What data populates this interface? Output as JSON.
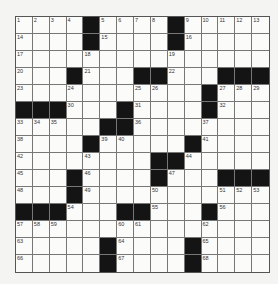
{
  "puzzle": {
    "rows": 15,
    "cols": 15,
    "block_color": "#141414",
    "grid": [
      [
        "1",
        "2",
        "3",
        "4",
        "#",
        "5",
        "6",
        "7",
        "8",
        "#",
        "9",
        "10",
        "11",
        "12",
        "13"
      ],
      [
        "14",
        ".",
        ".",
        ".",
        "#",
        "15",
        ".",
        ".",
        ".",
        "#",
        "16",
        ".",
        ".",
        ".",
        "."
      ],
      [
        "17",
        ".",
        ".",
        ".",
        "18",
        ".",
        ".",
        ".",
        ".",
        "19",
        ".",
        ".",
        ".",
        ".",
        "."
      ],
      [
        "20",
        ".",
        ".",
        "#",
        "21",
        ".",
        ".",
        "#",
        "#",
        "22",
        ".",
        ".",
        "#",
        "#",
        "#"
      ],
      [
        "23",
        ".",
        ".",
        "24",
        ".",
        ".",
        ".",
        "25",
        "26",
        ".",
        ".",
        "#",
        "27",
        "28",
        "29"
      ],
      [
        "#",
        "#",
        "#",
        "30",
        ".",
        ".",
        "#",
        "31",
        ".",
        ".",
        ".",
        "#",
        "32",
        ".",
        "."
      ],
      [
        "33",
        "34",
        "35",
        ".",
        ".",
        "#",
        "#",
        "36",
        ".",
        ".",
        ".",
        "37",
        ".",
        ".",
        "."
      ],
      [
        "38",
        ".",
        ".",
        ".",
        "#",
        "39",
        "40",
        ".",
        ".",
        ".",
        "#",
        "41",
        ".",
        ".",
        "."
      ],
      [
        "42",
        ".",
        ".",
        ".",
        "43",
        ".",
        ".",
        ".",
        "#",
        "#",
        "44",
        ".",
        ".",
        ".",
        "."
      ],
      [
        "45",
        ".",
        ".",
        "#",
        "46",
        ".",
        ".",
        ".",
        "#",
        "47",
        ".",
        ".",
        "#",
        "#",
        "#"
      ],
      [
        "48",
        ".",
        ".",
        "#",
        "49",
        ".",
        ".",
        ".",
        "50",
        ".",
        ".",
        ".",
        "51",
        "52",
        "53"
      ],
      [
        "#",
        "#",
        "#",
        "54",
        ".",
        ".",
        "#",
        "#",
        "55",
        ".",
        ".",
        "#",
        "56",
        ".",
        "."
      ],
      [
        "57",
        "58",
        "59",
        ".",
        ".",
        ".",
        "60",
        "61",
        ".",
        ".",
        ".",
        "62",
        ".",
        ".",
        "."
      ],
      [
        "63",
        ".",
        ".",
        ".",
        ".",
        "#",
        "64",
        ".",
        ".",
        ".",
        "#",
        "65",
        ".",
        ".",
        "."
      ],
      [
        "66",
        ".",
        ".",
        ".",
        ".",
        "#",
        "67",
        ".",
        ".",
        ".",
        "#",
        "68",
        ".",
        ".",
        "."
      ]
    ]
  }
}
